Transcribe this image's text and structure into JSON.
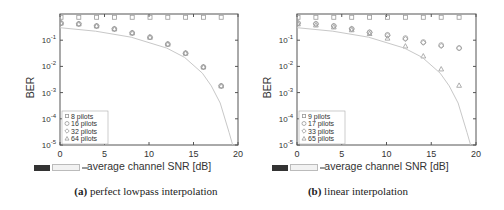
{
  "chart_data": [
    {
      "type": "scatter",
      "panel": "a",
      "caption_label": "(a)",
      "caption_text": "perfect lowpass interpolation",
      "xlabel": "average channel SNR [dB]",
      "ylabel": "BER",
      "xlim": [
        0,
        20
      ],
      "ylim": [
        1e-05,
        1
      ],
      "yscale": "log",
      "xticks": [
        "0",
        "5",
        "10",
        "15",
        "20"
      ],
      "yticks": [
        "10-1",
        "10-2",
        "10-3",
        "10-4",
        "10-5"
      ],
      "legend_position": "lower-left",
      "x": [
        0,
        2,
        4,
        6,
        8,
        10,
        12,
        14,
        16,
        18
      ],
      "series": [
        {
          "name": "8 pilots",
          "marker": "square",
          "values": [
            0.75,
            0.75,
            0.75,
            0.75,
            0.75,
            0.75,
            0.75,
            0.75,
            0.75,
            0.75
          ]
        },
        {
          "name": "16 pilots",
          "marker": "circle",
          "values": [
            0.45,
            0.42,
            0.35,
            0.27,
            0.19,
            0.13,
            0.071,
            0.032,
            0.0095,
            0.0018
          ]
        },
        {
          "name": "32 pilots",
          "marker": "diamond",
          "values": [
            0.45,
            0.42,
            0.35,
            0.27,
            0.19,
            0.13,
            0.071,
            0.032,
            0.0095,
            0.0018
          ]
        },
        {
          "name": "64 pilots",
          "marker": "triangle",
          "values": [
            0.45,
            0.42,
            0.35,
            0.27,
            0.19,
            0.13,
            0.071,
            0.032,
            0.0095,
            0.0018
          ]
        },
        {
          "name": "theory",
          "marker": "line",
          "x": [
            0,
            4,
            8,
            12,
            14,
            16,
            17,
            18,
            19,
            19.4
          ],
          "values": [
            0.3,
            0.22,
            0.13,
            0.05,
            0.022,
            0.0055,
            0.0018,
            0.0004,
            3e-05,
            1e-05
          ]
        }
      ]
    },
    {
      "type": "scatter",
      "panel": "b",
      "caption_label": "(b)",
      "caption_text": "linear interpolation",
      "xlabel": "average channel SNR [dB]",
      "ylabel": "BER",
      "xlim": [
        0,
        20
      ],
      "ylim": [
        1e-05,
        1
      ],
      "yscale": "log",
      "xticks": [
        "0",
        "5",
        "10",
        "15",
        "20"
      ],
      "yticks": [
        "10-1",
        "10-2",
        "10-3",
        "10-4",
        "10-5"
      ],
      "legend_position": "lower-left",
      "x": [
        0,
        2,
        4,
        6,
        8,
        10,
        12,
        14,
        16,
        18
      ],
      "series": [
        {
          "name": "9 pilots",
          "marker": "square",
          "values": [
            0.75,
            0.75,
            0.75,
            0.75,
            0.75,
            0.75,
            0.75,
            0.75,
            0.75,
            0.75
          ]
        },
        {
          "name": "17 pilots",
          "marker": "circle",
          "values": [
            0.45,
            0.42,
            0.35,
            0.27,
            0.2,
            0.16,
            0.12,
            0.085,
            0.065,
            0.05
          ]
        },
        {
          "name": "33 pilots",
          "marker": "diamond",
          "values": [
            0.45,
            0.42,
            0.35,
            0.27,
            0.2,
            0.15,
            0.11,
            0.08,
            0.06,
            0.05
          ]
        },
        {
          "name": "65 pilots",
          "marker": "triangle",
          "values": [
            0.42,
            0.38,
            0.32,
            0.25,
            0.18,
            0.12,
            0.06,
            0.025,
            0.008,
            0.0019
          ]
        },
        {
          "name": "theory",
          "marker": "line",
          "x": [
            0,
            4,
            8,
            12,
            14,
            16,
            17,
            18,
            19,
            19.4
          ],
          "values": [
            0.3,
            0.22,
            0.13,
            0.05,
            0.022,
            0.0055,
            0.0018,
            0.0004,
            3e-05,
            1e-05
          ]
        }
      ]
    }
  ],
  "panels": [
    {
      "caption_label": "(a)",
      "caption_text": "perfect lowpass interpolation"
    },
    {
      "caption_label": "(b)",
      "caption_text": "linear interpolation"
    }
  ],
  "colors": {
    "axis": "#555555",
    "marker": "#9a9a9a",
    "curve": "#c8c8c8",
    "text": "#333333"
  }
}
